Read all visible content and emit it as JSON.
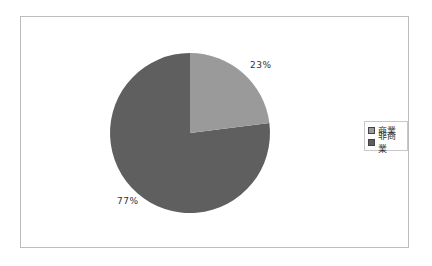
{
  "chart_data": {
    "type": "pie",
    "title": "",
    "categories": [
      "商業",
      "非商業"
    ],
    "values": [
      23,
      77
    ],
    "labels": [
      "23%",
      "77%"
    ],
    "colors": [
      "#9a9a9a",
      "#5f5f5f"
    ],
    "legend_position": "right"
  },
  "legend": {
    "items": [
      {
        "label": "商業",
        "color": "#9a9a9a"
      },
      {
        "label": "非商業",
        "color": "#5f5f5f"
      }
    ]
  },
  "labels": {
    "slice1": "23%",
    "slice2": "77%"
  }
}
